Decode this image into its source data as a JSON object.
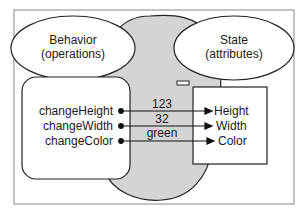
{
  "diagram": {
    "behavior_ellipse": {
      "line1": "Behavior",
      "line2": "(operations)"
    },
    "state_ellipse": {
      "line1": "State",
      "line2": "(attributes)"
    },
    "operations": [
      "changeHeight",
      "changeWidth",
      "changeColor"
    ],
    "attributes": [
      "Height",
      "Width",
      "Color"
    ],
    "values": [
      "123",
      "32",
      "green"
    ],
    "colors": {
      "blob": "#d4d4d4",
      "stroke": "#222222",
      "frame": "#888888"
    }
  }
}
